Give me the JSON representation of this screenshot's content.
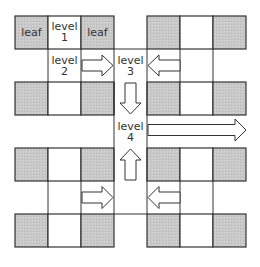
{
  "diagram": {
    "type": "hierarchical grid / binary tree levels",
    "colors": {
      "leaf_fill": "#c8c8c8",
      "cell_fill": "#ffffff",
      "line": "#333333",
      "arrow_fill": "#ffffff"
    },
    "labels": {
      "leaf_left": "leaf",
      "leaf_right": "leaf",
      "level1_word": "level",
      "level1_num": "1",
      "level2_word": "level",
      "level2_num": "2",
      "level3_word": "level",
      "level3_num": "3",
      "level4_word": "level",
      "level4_num": "4"
    },
    "arrows": [
      {
        "from": "level 2",
        "to": "level 3",
        "direction": "right"
      },
      {
        "from": "right block row 2",
        "to": "level 3",
        "direction": "left"
      },
      {
        "from": "level 3",
        "to": "level 4",
        "direction": "down"
      },
      {
        "from": "lower half",
        "to": "level 4",
        "direction": "up"
      },
      {
        "from": "level 4",
        "to": "right edge",
        "direction": "right"
      },
      {
        "from": "lower-left block",
        "to": "center column",
        "direction": "right"
      },
      {
        "from": "lower-right block",
        "to": "center column",
        "direction": "left"
      }
    ]
  }
}
